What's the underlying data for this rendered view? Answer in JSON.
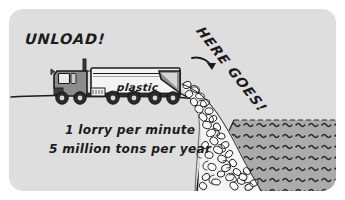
{
  "illustration": {
    "title": "Lorry unloading plastic waste over a cliff into the sea",
    "card": {
      "background_color": "#dedede",
      "outer_background_color": "#ffffff",
      "corner_radius": "14px"
    },
    "annotations": {
      "unload_label": "UNLOAD!",
      "here_goes_label": "HERE GOES!",
      "arrow": "curved-arrow-down-right"
    },
    "vehicle": {
      "type": "lorry",
      "cargo_label": "plastic",
      "wheel_count": 6,
      "tipper_raised": true,
      "cab_color": "#8c8c8c",
      "trailer_color": "#f2f2f2",
      "outline_color": "#1b1b1b"
    },
    "statistics": {
      "line_1": "1 lorry per minute",
      "line_2": "5 million tons per year"
    },
    "scene_elements": {
      "ground_line": "horizontal ground baseline under the lorry",
      "cliff": "vertical drop at right of lorry",
      "rubble": "spilling pile of plastic debris",
      "water": "sea with wave tick marks",
      "water_color": "#ababab",
      "ink_color": "#1b1b1b"
    }
  }
}
